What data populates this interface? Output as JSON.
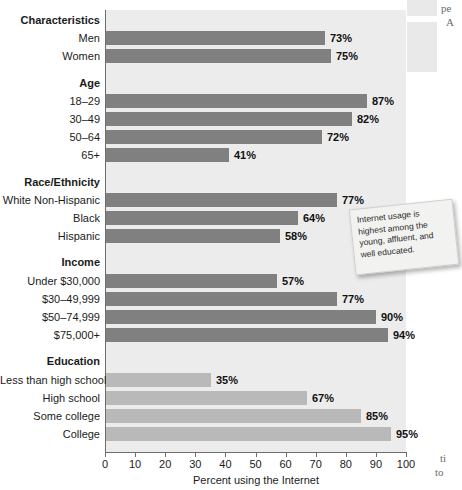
{
  "chart_data": {
    "type": "bar",
    "orientation": "horizontal",
    "title": "",
    "xlabel": "Percent using the Internet",
    "ylabel": "",
    "xlim": [
      0,
      100
    ],
    "xticks": [
      0,
      10,
      20,
      30,
      40,
      50,
      60,
      70,
      80,
      90,
      100
    ],
    "grid": false,
    "legend": "none",
    "value_suffix": "%",
    "groups": [
      {
        "name": "Characteristics",
        "shade": "dark",
        "items": [
          {
            "label": "Men",
            "value": 73,
            "display": "73%"
          },
          {
            "label": "Women",
            "value": 75,
            "display": "75%"
          }
        ]
      },
      {
        "name": "Age",
        "shade": "dark",
        "items": [
          {
            "label": "18–29",
            "value": 87,
            "display": "87%"
          },
          {
            "label": "30–49",
            "value": 82,
            "display": "82%"
          },
          {
            "label": "50–64",
            "value": 72,
            "display": "72%"
          },
          {
            "label": "65+",
            "value": 41,
            "display": "41%"
          }
        ]
      },
      {
        "name": "Race/Ethnicity",
        "shade": "dark",
        "items": [
          {
            "label": "White Non-Hispanic",
            "value": 77,
            "display": "77%"
          },
          {
            "label": "Black",
            "value": 64,
            "display": "64%"
          },
          {
            "label": "Hispanic",
            "value": 58,
            "display": "58%"
          }
        ]
      },
      {
        "name": "Income",
        "shade": "dark",
        "items": [
          {
            "label": "Under $30,000",
            "value": 57,
            "display": "57%"
          },
          {
            "label": "$30–49,999",
            "value": 77,
            "display": "77%"
          },
          {
            "label": "$50–74,999",
            "value": 90,
            "display": "90%"
          },
          {
            "label": "$75,000+",
            "value": 94,
            "display": "94%"
          }
        ]
      },
      {
        "name": "Education",
        "shade": "light",
        "items": [
          {
            "label": "Less than high school",
            "value": 35,
            "display": "35%"
          },
          {
            "label": "High school",
            "value": 67,
            "display": "67%"
          },
          {
            "label": "Some college",
            "value": 85,
            "display": "85%"
          },
          {
            "label": "College",
            "value": 95,
            "display": "95%"
          }
        ]
      }
    ],
    "colors": {
      "bar_dark": "#808080",
      "bar_light": "#b9b9b9",
      "plot_background": "#ececec",
      "axis": "#6d6d6d",
      "text": "#1b1b1b"
    }
  },
  "callout": {
    "text": "Internet usage is highest among the young, affluent, and well educated."
  },
  "margin_text": {
    "top_fragment_1": "pe",
    "top_fragment_2": "A",
    "bottom_fragment_1": "ti",
    "bottom_fragment_2": "to"
  }
}
